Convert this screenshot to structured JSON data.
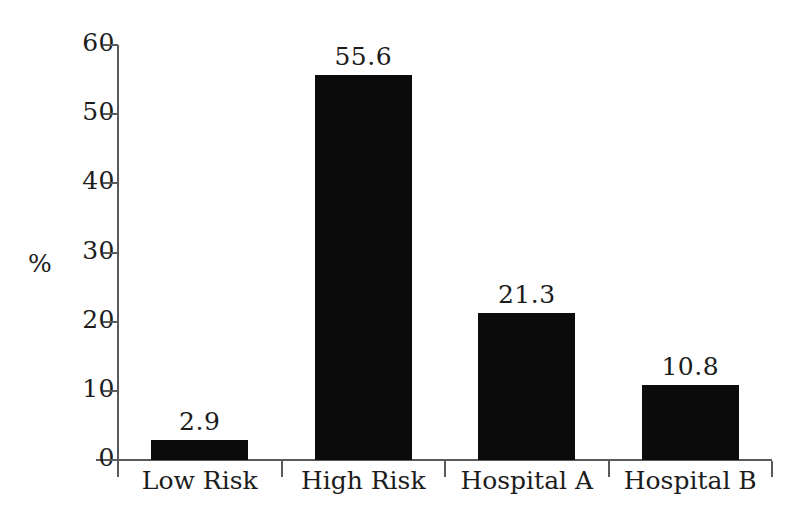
{
  "chart_data": {
    "type": "bar",
    "title": "",
    "xlabel": "",
    "ylabel": "%",
    "categories": [
      "Low Risk",
      "High Risk",
      "Hospital A",
      "Hospital B"
    ],
    "values": [
      2.9,
      55.6,
      21.3,
      10.8
    ],
    "value_labels": [
      "2.9",
      "55.6",
      "21.3",
      "10.8"
    ],
    "ylim": [
      0,
      60
    ],
    "yticks": [
      0,
      10,
      20,
      30,
      40,
      50,
      60
    ],
    "ytick_labels": [
      "0",
      "10",
      "20",
      "30",
      "40",
      "50",
      "60"
    ],
    "grid": false,
    "legend": false,
    "bar_color": "#0b0b0b",
    "axis_color": "#5a5a5a",
    "text_color": "#1c1c1c",
    "background_color": "#ffffff"
  }
}
